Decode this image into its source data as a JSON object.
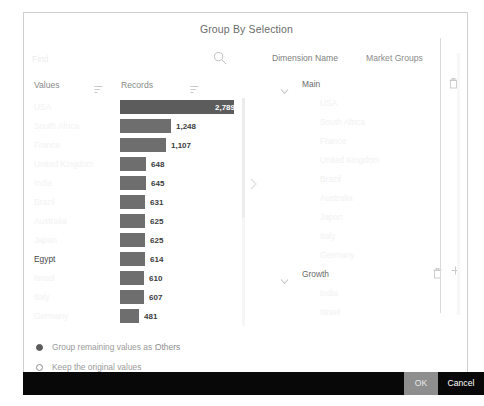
{
  "dialog": {
    "title": "Group By Selection"
  },
  "left": {
    "search": {
      "placeholder": "Find",
      "value": "",
      "icon": "search-icon"
    },
    "columns": {
      "values": "Values",
      "records": "Records",
      "sort_icon": "sort-filter-icon"
    },
    "rows": [
      {
        "label": "USA",
        "value": "2,789",
        "bar_pct": 100,
        "label_inside": true,
        "strong": false
      },
      {
        "label": "South Africa",
        "value": "1,248",
        "bar_pct": 45,
        "label_inside": false,
        "strong": false
      },
      {
        "label": "France",
        "value": "1,107",
        "bar_pct": 40,
        "label_inside": false,
        "strong": false
      },
      {
        "label": "United Kingdom",
        "value": "648",
        "bar_pct": 23,
        "label_inside": false,
        "strong": false
      },
      {
        "label": "India",
        "value": "645",
        "bar_pct": 23,
        "label_inside": false,
        "strong": false
      },
      {
        "label": "Brazil",
        "value": "631",
        "bar_pct": 22,
        "label_inside": false,
        "strong": false
      },
      {
        "label": "Australia",
        "value": "625",
        "bar_pct": 22,
        "label_inside": false,
        "strong": false
      },
      {
        "label": "Japan",
        "value": "625",
        "bar_pct": 22,
        "label_inside": false,
        "strong": false
      },
      {
        "label": "Egypt",
        "value": "614",
        "bar_pct": 22,
        "label_inside": false,
        "strong": true
      },
      {
        "label": "Israel",
        "value": "610",
        "bar_pct": 21,
        "label_inside": false,
        "strong": false
      },
      {
        "label": "Italy",
        "value": "607",
        "bar_pct": 21,
        "label_inside": false,
        "strong": false
      },
      {
        "label": "Germany",
        "value": "481",
        "bar_pct": 17,
        "label_inside": false,
        "strong": false
      }
    ]
  },
  "right": {
    "dimension_name_label": "Dimension Name",
    "dimension_name_value": "Market Groups",
    "groups": [
      {
        "name": "Main",
        "expanded": true,
        "has_add": false,
        "children": [
          "USA",
          "South Africa",
          "France",
          "United Kingdom",
          "Brazil",
          "Australia",
          "Japan",
          "Italy",
          "Germany"
        ]
      },
      {
        "name": "Growth",
        "expanded": true,
        "has_add": true,
        "children": [
          "India",
          "Israel"
        ]
      }
    ]
  },
  "options": {
    "group_remaining_label": "Group remaining values as :",
    "group_remaining_value": "Others",
    "keep_original_label": "Keep the original values",
    "selected": "group_remaining"
  },
  "footer": {
    "ok_label": "OK",
    "cancel_label": "Cancel"
  },
  "colors": {
    "bar": "#6e6e6e",
    "bar_primary": "#5c5c5c",
    "footer_bg": "#080808",
    "ok_bg": "#8e8e8e"
  }
}
